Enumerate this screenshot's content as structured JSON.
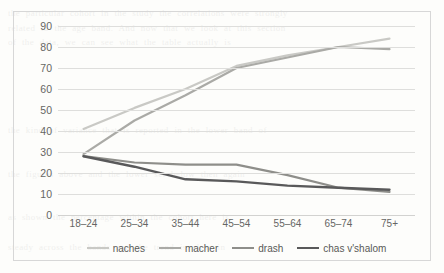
{
  "figure": {
    "border_color": "#d7d7d7",
    "background": "#fdfdfb",
    "gridline_color": "#dededc"
  },
  "bleed_text": "the particular cohort in the study the correlations were strongly\nrelated to the age band. And now that we look at this section\nof the data, we can see what the table actually is\n\n\n\n\n\nthe kind of variance that is reported in the lower band of\n\n\nthe figures above and the lower set below then again\n\n\nas shown the percentage within the cohort here is\n\nsteady across the bands and the trend is clear in\n\n\nthe responses to each of the four categories (1.12)\n",
  "chart_data": {
    "type": "line",
    "title": "",
    "xlabel": "",
    "ylabel": "",
    "categories": [
      "18–24",
      "25–34",
      "35–44",
      "45–54",
      "55–64",
      "65–74",
      "75+"
    ],
    "ylim": [
      0,
      90
    ],
    "yticks": [
      0,
      10,
      20,
      30,
      40,
      50,
      60,
      70,
      80,
      90
    ],
    "ytick_labels": [
      "0",
      "10",
      "20",
      "30",
      "40",
      "50",
      "60",
      "70",
      "80",
      "90"
    ],
    "grid": true,
    "legend_position": "bottom",
    "series": [
      {
        "name": "naches",
        "color": "#c9c9c5",
        "width": 2.2,
        "values": [
          41,
          51,
          60,
          71,
          76,
          80,
          84
        ]
      },
      {
        "name": "macher",
        "color": "#aaaaa6",
        "width": 2.2,
        "values": [
          29,
          45,
          57,
          70,
          75,
          80,
          79
        ]
      },
      {
        "name": "drash",
        "color": "#8e8e8a",
        "width": 2.2,
        "values": [
          28,
          25,
          24,
          24,
          19,
          13,
          11
        ]
      },
      {
        "name": "chas v'shalom",
        "color": "#59595a",
        "width": 2.4,
        "values": [
          28,
          23,
          17,
          16,
          14,
          13,
          12
        ]
      }
    ]
  },
  "legend": {
    "items": [
      "naches",
      "macher",
      "drash",
      "chas v'shalom"
    ]
  }
}
